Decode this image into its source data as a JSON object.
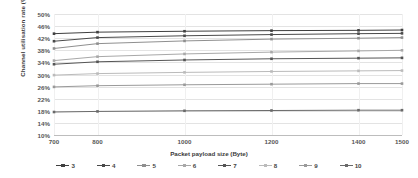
{
  "chart_data": {
    "type": "line",
    "title": "",
    "xlabel": "Packet payload size (Byte)",
    "ylabel": "Channel utilisation rate (%)",
    "x": [
      700,
      800,
      1000,
      1200,
      1400,
      1500
    ],
    "xticklabels": [
      "700",
      "800",
      "1000",
      "1200",
      "1400",
      "1500"
    ],
    "yticklabels": [
      "50%",
      "46%",
      "42%",
      "38%",
      "34%",
      "30%",
      "26%",
      "22%",
      "18%",
      "14%",
      "10%"
    ],
    "ylim": [
      10,
      50
    ],
    "ytick_step": 4,
    "grid": "horizontal",
    "legend_position": "bottom",
    "series": [
      {
        "name": "3",
        "color": "#3f3f3f",
        "marker": "square",
        "values": [
          43.5,
          44.0,
          44.3,
          44.5,
          44.6,
          44.7
        ]
      },
      {
        "name": "4",
        "color": "#4a4a4a",
        "marker": "square",
        "values": [
          41.0,
          42.2,
          42.8,
          43.2,
          43.5,
          43.6
        ]
      },
      {
        "name": "5",
        "color": "#8f8f8f",
        "marker": "square",
        "values": [
          38.6,
          40.2,
          41.1,
          41.7,
          42.0,
          42.2
        ]
      },
      {
        "name": "6",
        "color": "#a8a8a8",
        "marker": "square",
        "values": [
          34.6,
          35.9,
          36.8,
          37.4,
          37.8,
          38.0
        ]
      },
      {
        "name": "7",
        "color": "#555555",
        "marker": "square",
        "values": [
          33.4,
          34.2,
          34.8,
          35.2,
          35.4,
          35.5
        ]
      },
      {
        "name": "8",
        "color": "#bbbbbb",
        "marker": "square",
        "values": [
          29.8,
          30.3,
          30.7,
          31.0,
          31.2,
          31.3
        ]
      },
      {
        "name": "9",
        "color": "#9a9a9a",
        "marker": "square",
        "values": [
          25.9,
          26.3,
          26.6,
          26.8,
          27.0,
          27.0
        ]
      },
      {
        "name": "10",
        "color": "#6a6a6a",
        "marker": "square",
        "values": [
          17.6,
          17.8,
          18.0,
          18.1,
          18.2,
          18.2
        ]
      }
    ]
  }
}
